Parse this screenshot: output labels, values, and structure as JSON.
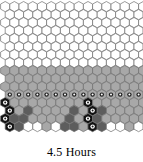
{
  "figure": {
    "caption": "4.5 Hours",
    "background_color": "#ffffff"
  },
  "grid": {
    "type": "hexagon-lattice",
    "orientation": "pointy-top",
    "columns": 16,
    "rows": 16,
    "hex_width": 9.2,
    "hex_height": 10.2,
    "row_pitch": 8.0,
    "col_pitch": 9.2,
    "stroke_color": "#6e6e6e",
    "stroke_width": 0.7,
    "origin_x": 0.6,
    "origin_y": 1.5
  },
  "palette": {
    "empty": "#ffffff",
    "light": "#e8e8e8",
    "mid_light": "#c9c9c9",
    "mid": "#a8a8a8",
    "mid_dark": "#8c8c8c",
    "dark": "#5d5d5d",
    "very_dark": "#3a3a3a",
    "black": "#111111",
    "marker_fill": "#ffffff",
    "marker_ring": "#202020",
    "marker_ring_on_black": "#ffffff"
  },
  "legend": {
    "empty_label": "empty cell",
    "filled_label": "filled cell",
    "marked_label": "marked cell"
  },
  "chart_data": {
    "type": "heatmap",
    "title": "4.5 Hours",
    "xlabel": "",
    "ylabel": "",
    "grid": true,
    "legend_position": "none",
    "value_colors": {
      "0": "#ffffff",
      "1": "#e8e8e8",
      "2": "#c9c9c9",
      "3": "#a8a8a8",
      "4": "#8c8c8c",
      "5": "#5d5d5d",
      "6": "#3a3a3a",
      "7": "#111111"
    },
    "rows": [
      {
        "index": 0,
        "offset": false,
        "cells": [
          0,
          0,
          0,
          0,
          0,
          0,
          0,
          0,
          0,
          0,
          0,
          0,
          0,
          0,
          0,
          0
        ],
        "markers": []
      },
      {
        "index": 1,
        "offset": true,
        "cells": [
          0,
          0,
          0,
          0,
          0,
          0,
          0,
          0,
          0,
          0,
          0,
          0,
          0,
          0,
          0,
          0
        ],
        "markers": []
      },
      {
        "index": 2,
        "offset": false,
        "cells": [
          0,
          0,
          0,
          0,
          0,
          0,
          0,
          0,
          0,
          0,
          0,
          0,
          0,
          0,
          0,
          0
        ],
        "markers": []
      },
      {
        "index": 3,
        "offset": true,
        "cells": [
          0,
          0,
          0,
          0,
          0,
          0,
          0,
          0,
          0,
          0,
          0,
          0,
          0,
          0,
          0,
          0
        ],
        "markers": []
      },
      {
        "index": 4,
        "offset": false,
        "cells": [
          0,
          0,
          0,
          0,
          0,
          0,
          0,
          0,
          0,
          0,
          0,
          0,
          0,
          0,
          0,
          0
        ],
        "markers": []
      },
      {
        "index": 5,
        "offset": true,
        "cells": [
          0,
          0,
          0,
          0,
          0,
          0,
          0,
          0,
          0,
          0,
          0,
          0,
          0,
          0,
          0,
          0
        ],
        "markers": []
      },
      {
        "index": 6,
        "offset": false,
        "cells": [
          0,
          0,
          0,
          0,
          0,
          0,
          0,
          0,
          0,
          0,
          0,
          0,
          0,
          0,
          0,
          0
        ],
        "markers": []
      },
      {
        "index": 7,
        "offset": true,
        "cells": [
          0,
          0,
          0,
          0,
          0,
          0,
          0,
          0,
          0,
          0,
          0,
          0,
          0,
          0,
          0,
          0
        ],
        "markers": []
      },
      {
        "index": 8,
        "offset": false,
        "cells": [
          3,
          3,
          3,
          3,
          3,
          3,
          3,
          3,
          3,
          3,
          3,
          3,
          3,
          3,
          3,
          3
        ],
        "markers": []
      },
      {
        "index": 9,
        "offset": true,
        "cells": [
          3,
          3,
          3,
          3,
          3,
          3,
          3,
          3,
          3,
          3,
          3,
          3,
          3,
          3,
          3,
          3
        ],
        "markers": []
      },
      {
        "index": 10,
        "offset": false,
        "cells": [
          3,
          3,
          3,
          3,
          3,
          3,
          3,
          3,
          3,
          3,
          3,
          3,
          3,
          3,
          3,
          3
        ],
        "markers": []
      },
      {
        "index": 11,
        "offset": true,
        "cells": [
          3,
          3,
          3,
          3,
          3,
          3,
          3,
          3,
          3,
          3,
          3,
          3,
          3,
          3,
          3,
          3
        ],
        "markers": [
          0,
          1,
          2,
          3,
          4,
          5,
          6,
          7,
          8,
          9,
          10,
          11,
          12,
          13,
          14,
          15
        ]
      },
      {
        "index": 12,
        "offset": false,
        "cells": [
          7,
          3,
          3,
          3,
          3,
          3,
          3,
          3,
          3,
          7,
          3,
          3,
          3,
          3,
          3,
          3
        ],
        "markers": [
          0,
          9
        ]
      },
      {
        "index": 13,
        "offset": true,
        "cells": [
          7,
          3,
          5,
          3,
          3,
          3,
          3,
          5,
          3,
          7,
          5,
          3,
          3,
          3,
          3,
          3
        ],
        "markers": [
          0,
          9
        ]
      },
      {
        "index": 14,
        "offset": false,
        "cells": [
          7,
          5,
          5,
          3,
          3,
          3,
          3,
          5,
          3,
          7,
          5,
          3,
          3,
          3,
          3,
          3
        ],
        "markers": [
          0,
          9
        ]
      },
      {
        "index": 15,
        "offset": true,
        "cells": [
          7,
          5,
          0,
          0,
          3,
          0,
          5,
          5,
          3,
          7,
          5,
          0,
          0,
          3,
          0,
          0
        ],
        "markers": [
          0,
          9
        ]
      }
    ]
  }
}
